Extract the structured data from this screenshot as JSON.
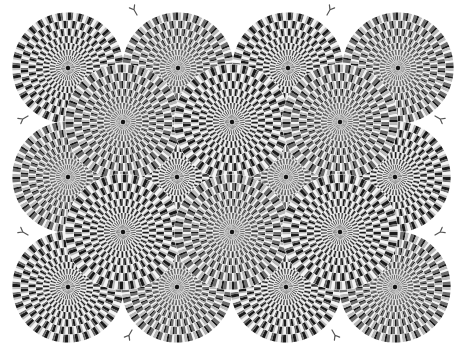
{
  "image": {
    "width": 463,
    "height": 354,
    "description": "Rotating snakes optical illusion: overlapping circular disks of concentric rings made of black, dark gray, white and light gray segments",
    "background": "#ffffff",
    "palette": [
      "#1a1a1a",
      "#6e6e6e",
      "#f4f4f4",
      "#b9b9b9"
    ],
    "center_dot_color": "#111111"
  },
  "disks": [
    {
      "cx": 68,
      "cy": 68,
      "r": 56,
      "dir": 1
    },
    {
      "cx": 178,
      "cy": 68,
      "r": 56,
      "dir": -1
    },
    {
      "cx": 288,
      "cy": 68,
      "r": 56,
      "dir": 1
    },
    {
      "cx": 398,
      "cy": 68,
      "r": 56,
      "dir": -1
    },
    {
      "cx": 68,
      "cy": 177,
      "r": 56,
      "dir": -1
    },
    {
      "cx": 177,
      "cy": 177,
      "r": 56,
      "dir": 1
    },
    {
      "cx": 286,
      "cy": 177,
      "r": 56,
      "dir": -1
    },
    {
      "cx": 395,
      "cy": 177,
      "r": 56,
      "dir": 1
    },
    {
      "cx": 68,
      "cy": 287,
      "r": 56,
      "dir": 1
    },
    {
      "cx": 177,
      "cy": 287,
      "r": 56,
      "dir": -1
    },
    {
      "cx": 286,
      "cy": 287,
      "r": 56,
      "dir": 1
    },
    {
      "cx": 395,
      "cy": 287,
      "r": 56,
      "dir": -1
    },
    {
      "cx": 123,
      "cy": 122,
      "r": 58,
      "dir": -1
    },
    {
      "cx": 232,
      "cy": 122,
      "r": 58,
      "dir": 1
    },
    {
      "cx": 340,
      "cy": 122,
      "r": 58,
      "dir": -1
    },
    {
      "cx": 123,
      "cy": 232,
      "r": 58,
      "dir": 1
    },
    {
      "cx": 232,
      "cy": 232,
      "r": 58,
      "dir": -1
    },
    {
      "cx": 340,
      "cy": 232,
      "r": 58,
      "dir": 1
    }
  ],
  "tongues": [
    {
      "x": 137,
      "y": 15,
      "angle": -120
    },
    {
      "x": 327,
      "y": 15,
      "angle": -60
    },
    {
      "x": 28,
      "y": 116,
      "angle": 150
    },
    {
      "x": 435,
      "y": 116,
      "angle": 30
    },
    {
      "x": 28,
      "y": 235,
      "angle": -150
    },
    {
      "x": 435,
      "y": 235,
      "angle": -30
    },
    {
      "x": 132,
      "y": 330,
      "angle": 120
    },
    {
      "x": 332,
      "y": 330,
      "angle": 60
    }
  ],
  "rings": 9,
  "segments": 32
}
